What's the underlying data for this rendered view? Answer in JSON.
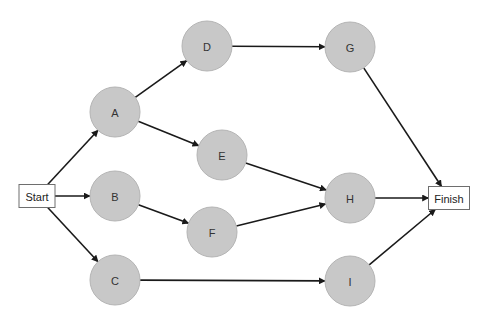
{
  "diagram": {
    "type": "network-precedence-diagram",
    "colors": {
      "activity_fill": "#c8c8c8",
      "activity_stroke": "#b4b4b4",
      "terminal_fill": "#ffffff",
      "terminal_stroke": "#6e6e6e",
      "edge": "#1a1a1a",
      "text": "#333333"
    },
    "nodes": [
      {
        "id": "start",
        "label": "Start",
        "shape": "box",
        "x": 37,
        "y": 196,
        "w": 36,
        "h": 23
      },
      {
        "id": "A",
        "label": "A",
        "shape": "circle",
        "x": 115,
        "y": 112,
        "r": 25
      },
      {
        "id": "B",
        "label": "B",
        "shape": "circle",
        "x": 115,
        "y": 196,
        "r": 25
      },
      {
        "id": "C",
        "label": "C",
        "shape": "circle",
        "x": 115,
        "y": 280,
        "r": 25
      },
      {
        "id": "D",
        "label": "D",
        "shape": "circle",
        "x": 207,
        "y": 46,
        "r": 25
      },
      {
        "id": "E",
        "label": "E",
        "shape": "circle",
        "x": 222,
        "y": 155,
        "r": 25
      },
      {
        "id": "F",
        "label": "F",
        "shape": "circle",
        "x": 212,
        "y": 232,
        "r": 25
      },
      {
        "id": "G",
        "label": "G",
        "shape": "circle",
        "x": 350,
        "y": 47,
        "r": 25
      },
      {
        "id": "H",
        "label": "H",
        "shape": "circle",
        "x": 350,
        "y": 198,
        "r": 25
      },
      {
        "id": "I",
        "label": "I",
        "shape": "circle",
        "x": 350,
        "y": 281,
        "r": 25
      },
      {
        "id": "finish",
        "label": "Finish",
        "shape": "box",
        "x": 449,
        "y": 198,
        "w": 41,
        "h": 23
      }
    ],
    "edges": [
      {
        "from": "start",
        "to": "A"
      },
      {
        "from": "start",
        "to": "B"
      },
      {
        "from": "start",
        "to": "C"
      },
      {
        "from": "A",
        "to": "D"
      },
      {
        "from": "A",
        "to": "E"
      },
      {
        "from": "B",
        "to": "F"
      },
      {
        "from": "D",
        "to": "G"
      },
      {
        "from": "E",
        "to": "H"
      },
      {
        "from": "F",
        "to": "H"
      },
      {
        "from": "C",
        "to": "I"
      },
      {
        "from": "G",
        "to": "finish"
      },
      {
        "from": "H",
        "to": "finish"
      },
      {
        "from": "I",
        "to": "finish"
      }
    ]
  }
}
